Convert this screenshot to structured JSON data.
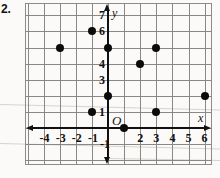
{
  "problem": {
    "number": "2."
  },
  "graph": {
    "axis_labels": {
      "x": "x",
      "y": "y",
      "origin": "O"
    },
    "x_tick_labels": [
      "-4",
      "-3",
      "-2",
      "-1",
      "2",
      "3",
      "4",
      "5",
      "6"
    ],
    "y_tick_labels": [
      "7",
      "6",
      "4",
      "3",
      "1",
      "-1"
    ],
    "colors": {
      "grid": "#8a8884",
      "axis": "#111111",
      "point": "#0b0b0b",
      "border": "#8e8c88"
    }
  },
  "chart_data": {
    "type": "scatter",
    "title": "",
    "xlabel": "x",
    "ylabel": "y",
    "xlim": [
      -5,
      7
    ],
    "ylim": [
      -2,
      8
    ],
    "grid": true,
    "legend": "none",
    "x_ticks": [
      -4,
      -3,
      -2,
      -1,
      1,
      2,
      3,
      4,
      5,
      6
    ],
    "x_ticks_shown": [
      -4,
      -3,
      -2,
      -1,
      2,
      3,
      4,
      5,
      6
    ],
    "y_ticks": [
      -1,
      1,
      2,
      3,
      4,
      5,
      6,
      7
    ],
    "y_ticks_shown": [
      7,
      6,
      4,
      3,
      1,
      -1
    ],
    "points": [
      {
        "x": -3,
        "y": 5
      },
      {
        "x": -1,
        "y": 6
      },
      {
        "x": -1,
        "y": 1
      },
      {
        "x": 0,
        "y": 5
      },
      {
        "x": 0,
        "y": 2
      },
      {
        "x": 1,
        "y": 0
      },
      {
        "x": 2,
        "y": 4
      },
      {
        "x": 3,
        "y": 5
      },
      {
        "x": 3,
        "y": 1
      },
      {
        "x": 6,
        "y": 2
      }
    ]
  }
}
